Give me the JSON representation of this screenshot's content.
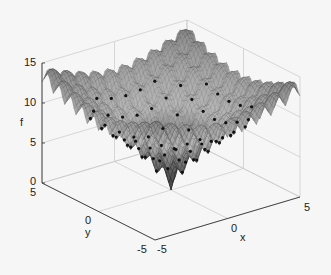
{
  "chart_data": {
    "type": "surface",
    "title": "",
    "xlabel": "x",
    "ylabel": "y",
    "zlabel": "f",
    "xlim": [
      -5,
      5
    ],
    "ylim": [
      -5,
      5
    ],
    "zlim": [
      0,
      15
    ],
    "xticks": [
      "-5",
      "0",
      "5"
    ],
    "yticks": [
      "5",
      "0",
      "-5"
    ],
    "zticks": [
      "0",
      "5",
      "10",
      "15"
    ],
    "grid": true,
    "colormap": "gray",
    "function_description": "Ackley-like multimodal surface with global minimum f≈0 at (0,0), many local peaks on an integer lattice, rising to about 13-14 near the domain corners",
    "global_minimum": {
      "x": 0,
      "y": 0,
      "f": 0
    },
    "max_approx": 14.3,
    "markers": "black dots at local minima on the integer grid"
  }
}
